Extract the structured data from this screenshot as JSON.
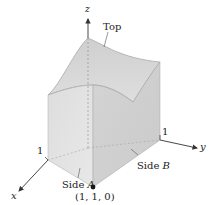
{
  "figure": {
    "axes": {
      "x_label": "x",
      "y_label": "y",
      "z_label": "z",
      "x_tick": "1",
      "y_tick": "1"
    },
    "labels": {
      "top": "Top",
      "side_a_prefix": "Side ",
      "side_a_letter": "A",
      "side_b_prefix": "Side ",
      "side_b_letter": "B",
      "corner_point": "(1, 1, 0)"
    },
    "colors": {
      "top_face": "#d6d6d6",
      "side_a_face": "#e2e2e2",
      "side_b_face": "#cfcfcf",
      "floor": "#ececec",
      "edge": "#9a9a9a",
      "axis": "#333333"
    }
  }
}
